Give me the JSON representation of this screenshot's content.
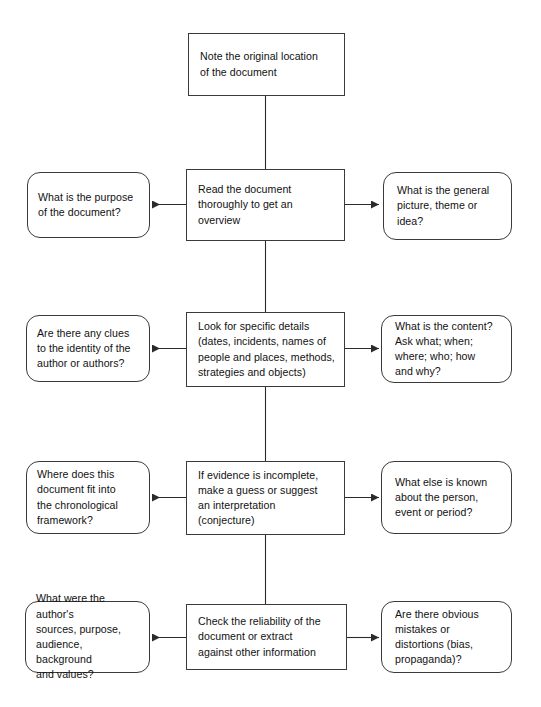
{
  "diagram": {
    "stroke_color": "#3a3a3a",
    "text_color": "#111111",
    "background": "#ffffff",
    "steps": [
      {
        "id": "step-1",
        "center": "Note the original location\nof the document",
        "left": null,
        "right": null
      },
      {
        "id": "step-2",
        "center": "Read the document\nthoroughly to get an\noverview",
        "left": "What is the purpose\nof the document?",
        "right": "What is the general\npicture, theme or\nidea?"
      },
      {
        "id": "step-3",
        "center": "Look for specific details\n(dates, incidents, names of\npeople and places, methods,\nstrategies and objects)",
        "left": "Are there any clues\nto the identity of the\nauthor or authors?",
        "right": "What is the content?\nAsk what; when;\nwhere; who; how\nand why?"
      },
      {
        "id": "step-4",
        "center": "If evidence is incomplete,\nmake a guess or suggest\nan interpretation\n(conjecture)",
        "left": "Where does this\ndocument fit into\nthe chronological\nframework?",
        "right": "What else is known\nabout the person,\nevent or period?"
      },
      {
        "id": "step-5",
        "center": "Check the reliability of the\ndocument or extract\nagainst other information",
        "left": "What were the author's\nsources, purpose,\naudience, background\nand values?",
        "right": "Are there obvious\nmistakes or\ndistortions (bias,\npropaganda)?"
      }
    ]
  }
}
